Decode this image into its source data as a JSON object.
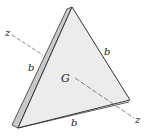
{
  "figure": {
    "type": "triangular-plate",
    "labels": {
      "side_left": "b",
      "side_right": "b",
      "side_bottom": "b",
      "centroid": "G",
      "axis_start": "z",
      "axis_end": "z"
    },
    "colors": {
      "face": "#ececec",
      "edge_strip": "#c9c9c9",
      "outline": "#333333",
      "axis": "#666666"
    }
  }
}
